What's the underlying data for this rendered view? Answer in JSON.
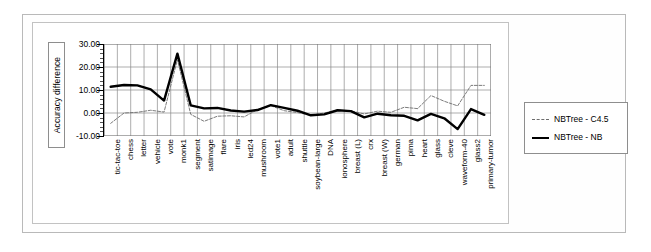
{
  "chart_data": {
    "type": "line",
    "title": "",
    "xlabel": "",
    "ylabel": "Accuracy difference",
    "ylim": [
      -10,
      30
    ],
    "yticks": [
      "-10.00",
      "0.00",
      "10.00",
      "20.00",
      "30.00"
    ],
    "ytick_values": [
      -10,
      0,
      10,
      20,
      30
    ],
    "grid": true,
    "legend_position": "right",
    "categories": [
      "tic-tac-toe",
      "chess",
      "letter",
      "vehicle",
      "vote",
      "monk1",
      "segment",
      "satimage",
      "flare",
      "iris",
      "led24",
      "mushroom",
      "vote1",
      "adult",
      "shuttle",
      "soybean-large",
      "DNA",
      "ionosphere",
      "breast (L)",
      "crx",
      "breast (W)",
      "german",
      "pima",
      "heart",
      "glass",
      "cleve",
      "waveform-40",
      "glass2",
      "primary-tumor"
    ],
    "series": [
      {
        "name": "NBTree - C4.5",
        "style": "dashed-thin",
        "color": "#6d6d6d",
        "values": [
          -4.5,
          0.0,
          0.3,
          1.2,
          0.4,
          23.2,
          -0.6,
          -3.6,
          -1.4,
          -1.2,
          -1.7,
          1.5,
          3.2,
          1.0,
          0.2,
          -1.0,
          0.0,
          1.3,
          0.9,
          -0.4,
          0.8,
          0.3,
          2.5,
          1.9,
          7.6,
          5.1,
          3.1,
          12.0,
          12.0
        ]
      },
      {
        "name": "NBTree - NB",
        "style": "solid-thick",
        "color": "#000000",
        "values": [
          11.4,
          12.2,
          12.0,
          10.3,
          5.4,
          25.8,
          3.3,
          2.0,
          2.2,
          1.1,
          0.6,
          1.3,
          3.4,
          2.2,
          1.0,
          -1.0,
          -0.6,
          1.2,
          0.8,
          -1.9,
          -0.3,
          -1.0,
          -1.2,
          -3.2,
          -0.4,
          -2.3,
          -7.0,
          1.7,
          -0.8
        ]
      }
    ]
  },
  "legend": {
    "items": [
      {
        "label": "NBTree - C4.5"
      },
      {
        "label": "NBTree - NB"
      }
    ]
  }
}
